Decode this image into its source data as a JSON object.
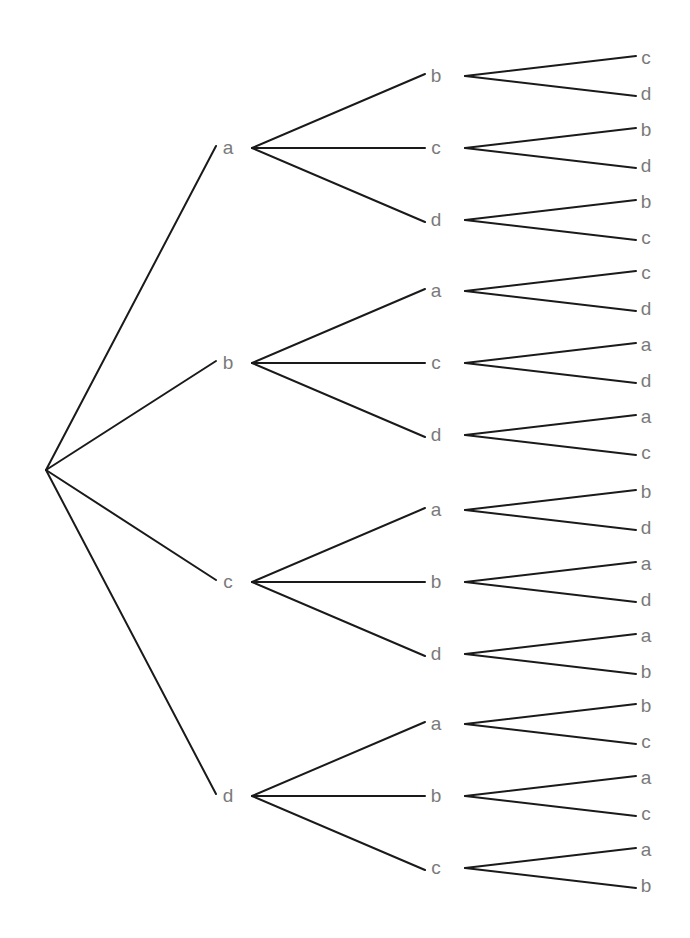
{
  "diagram": {
    "type": "tree",
    "root": {
      "label": ""
    },
    "level1": [
      {
        "label": "a",
        "children": [
          {
            "label": "b",
            "children": [
              "c",
              "d"
            ]
          },
          {
            "label": "c",
            "children": [
              "b",
              "d"
            ]
          },
          {
            "label": "d",
            "children": [
              "b",
              "c"
            ]
          }
        ]
      },
      {
        "label": "b",
        "children": [
          {
            "label": "a",
            "children": [
              "c",
              "d"
            ]
          },
          {
            "label": "c",
            "children": [
              "a",
              "d"
            ]
          },
          {
            "label": "d",
            "children": [
              "a",
              "c"
            ]
          }
        ]
      },
      {
        "label": "c",
        "children": [
          {
            "label": "a",
            "children": [
              "b",
              "d"
            ]
          },
          {
            "label": "b",
            "children": [
              "a",
              "d"
            ]
          },
          {
            "label": "d",
            "children": [
              "a",
              "b"
            ]
          }
        ]
      },
      {
        "label": "d",
        "children": [
          {
            "label": "a",
            "children": [
              "b",
              "c"
            ]
          },
          {
            "label": "b",
            "children": [
              "a",
              "c"
            ]
          },
          {
            "label": "c",
            "children": [
              "a",
              "b"
            ]
          }
        ]
      }
    ]
  },
  "colors": {
    "edge": "#1a1a1a",
    "label": "#7a7a7a",
    "background": "#ffffff"
  }
}
